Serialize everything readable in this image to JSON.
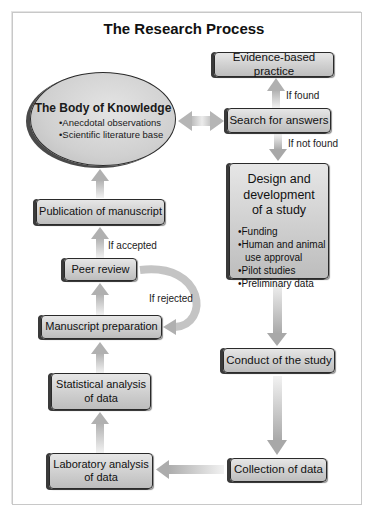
{
  "title": "The Research Process",
  "nodes": {
    "body_of_knowledge": {
      "heading": "The Body of Knowledge",
      "bullets": [
        "Anecdotal observations",
        "Scientific literature base"
      ]
    },
    "evidence_based_practice": "Evidence-based practice",
    "search_for_answers": "Search for answers",
    "design_development": {
      "heading_lines": [
        "Design and",
        "development",
        "of a study"
      ],
      "bullets": [
        "Funding",
        "Human and animal use approval",
        "Pilot studies",
        "Preliminary data"
      ]
    },
    "conduct_study": "Conduct of the study",
    "collection_data": "Collection of data",
    "laboratory_analysis": [
      "Laboratory analysis",
      "of data"
    ],
    "statistical_analysis": [
      "Statistical analysis",
      "of data"
    ],
    "manuscript_preparation": "Manuscript preparation",
    "peer_review": "Peer review",
    "publication": "Publication of manuscript"
  },
  "edge_labels": {
    "if_found": "If found",
    "if_not_found": "If not found",
    "if_accepted": "If accepted",
    "if_rejected": "If rejected"
  },
  "colors": {
    "box_fill": "#cfcfcf",
    "box_border": "#2a2a2a",
    "arrow": "#bdbdbd"
  }
}
